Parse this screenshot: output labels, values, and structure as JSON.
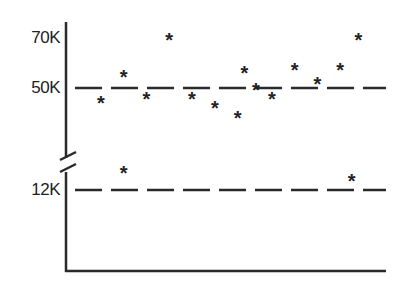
{
  "chart_data": {
    "type": "scatter",
    "title": "",
    "xlabel": "",
    "ylabel": "",
    "axis_break": true,
    "y_tick_labels": [
      "70K",
      "50K",
      "12K"
    ],
    "reference_lines": [
      {
        "label": "50K",
        "value": 50000,
        "style": "dashed"
      },
      {
        "label": "12K",
        "value": 12000,
        "style": "dashed"
      }
    ],
    "marker": "asterisk",
    "points_upper_band": [
      {
        "x": 1,
        "y": 45000
      },
      {
        "x": 2,
        "y": 55000
      },
      {
        "x": 3,
        "y": 46500
      },
      {
        "x": 4,
        "y": 69500
      },
      {
        "x": 5,
        "y": 46500
      },
      {
        "x": 6,
        "y": 43000
      },
      {
        "x": 7,
        "y": 39000
      },
      {
        "x": 7.3,
        "y": 56500
      },
      {
        "x": 7.8,
        "y": 50000
      },
      {
        "x": 8.5,
        "y": 46500
      },
      {
        "x": 9.5,
        "y": 58000
      },
      {
        "x": 10.5,
        "y": 52500
      },
      {
        "x": 11.5,
        "y": 58000
      },
      {
        "x": 12.3,
        "y": 69500
      }
    ],
    "points_lower_band": [
      {
        "x": 2,
        "y": 14500
      },
      {
        "x": 12,
        "y": 13500
      }
    ],
    "grid": false,
    "legend": null
  },
  "labels": {
    "y70": "70K",
    "y50": "50K",
    "y12": "12K"
  }
}
